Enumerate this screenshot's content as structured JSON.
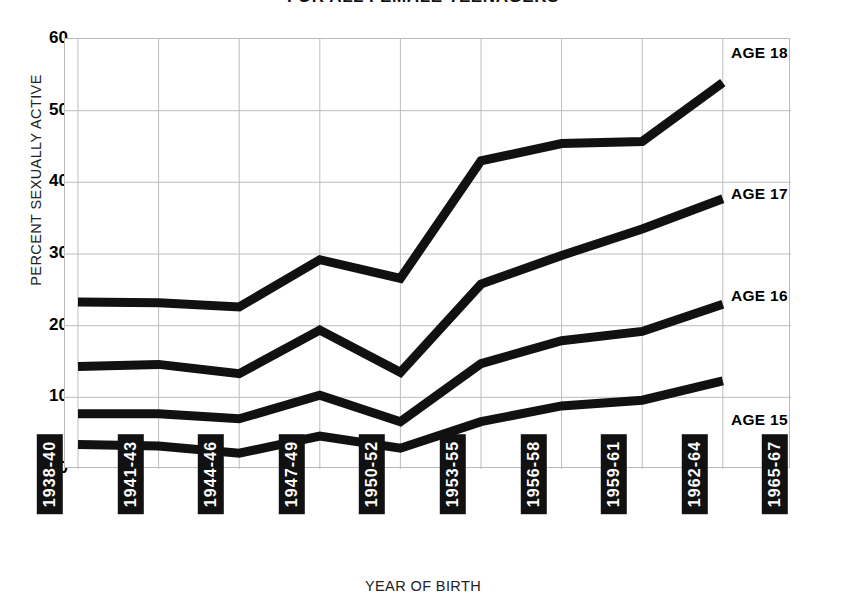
{
  "title": "FOR ALL FEMALE TEENAGERS",
  "axes": {
    "ylabel": "PERCENT SEXUALLY ACTIVE",
    "xlabel": "YEAR OF BIRTH",
    "yticks": [
      "60",
      "50",
      "40",
      "30",
      "20",
      "10",
      "0"
    ]
  },
  "series_labels": {
    "age18": "AGE 18",
    "age17": "AGE 17",
    "age16": "AGE 16",
    "age15": "AGE 15"
  },
  "chart_data": {
    "type": "line",
    "title": "FOR ALL FEMALE TEENAGERS",
    "xlabel": "YEAR OF BIRTH",
    "ylabel": "PERCENT SEXUALLY ACTIVE",
    "categories": [
      "1938-40",
      "1941-43",
      "1944-46",
      "1947-49",
      "1950-52",
      "1953-55",
      "1956-58",
      "1959-61",
      "1962-64",
      "1965-67"
    ],
    "ylim": [
      0,
      60
    ],
    "yticks": [
      0,
      10,
      20,
      30,
      40,
      50,
      60
    ],
    "grid": true,
    "legend": "line-end-labels-right",
    "series": [
      {
        "name": "AGE 18",
        "values": [
          23.3,
          23.2,
          22.6,
          29.2,
          26.6,
          43.0,
          45.4,
          45.7,
          53.9,
          null
        ]
      },
      {
        "name": "AGE 17",
        "values": [
          14.3,
          14.6,
          13.3,
          19.4,
          13.5,
          25.8,
          29.8,
          33.5,
          37.7,
          null
        ]
      },
      {
        "name": "AGE 16",
        "values": [
          7.7,
          7.7,
          7.0,
          10.3,
          6.6,
          14.7,
          17.9,
          19.2,
          23.0,
          null
        ]
      },
      {
        "name": "AGE 15",
        "values": [
          3.4,
          3.2,
          2.2,
          4.6,
          2.9,
          6.6,
          8.8,
          9.6,
          12.3,
          null
        ]
      }
    ]
  }
}
